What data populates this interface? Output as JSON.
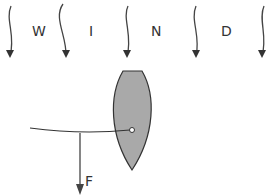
{
  "diagram": {
    "wind_letters": [
      "W",
      "I",
      "N",
      "D"
    ],
    "force_label": "F",
    "colors": {
      "hull": "#a9a9a9",
      "stroke": "#333333"
    }
  }
}
